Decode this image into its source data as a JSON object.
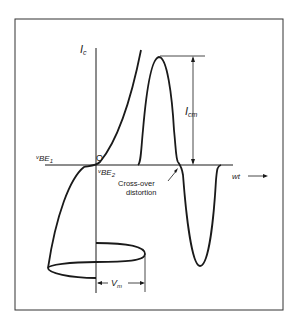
{
  "figure": {
    "labels": {
      "y_axis": "I",
      "y_axis_sub": "c",
      "origin": "O",
      "vbe1": "v",
      "vbe1_sub": "BE",
      "vbe1_sub2": "1",
      "vbe2": "v",
      "vbe2_sub": "BE",
      "vbe2_sub2": "2",
      "icm": "I",
      "icm_sub": "cm",
      "crossover_line1": "Cross-over",
      "crossover_line2": "distortion",
      "wt": "wt",
      "vm": "V",
      "vm_sub": "m"
    },
    "colors": {
      "stroke": "#1a1a1a",
      "background": "#ffffff",
      "frame": "#333333"
    }
  }
}
